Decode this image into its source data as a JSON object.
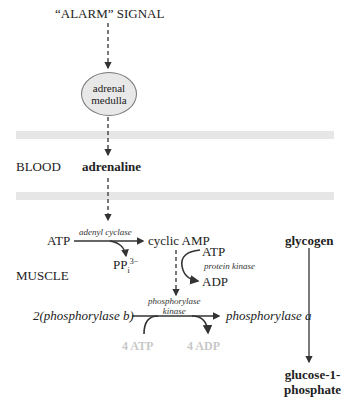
{
  "diagram": {
    "title_signal": "“ALARM” SIGNAL",
    "adrenal": {
      "line1": "adrenal",
      "line2": "medulla"
    },
    "blood_label": "BLOOD",
    "adrenaline": "adrenaline",
    "muscle_label": "MUSCLE",
    "atp_left": "ATP",
    "adenyl_cyclase": "adenyl cyclase",
    "cyclic_amp": "cyclic AMP",
    "ppi": {
      "base": "PP",
      "sub": "i",
      "sup": "3−"
    },
    "pk_atp": "ATP",
    "protein_kinase": "protein kinase",
    "pk_adp": "ADP",
    "phosphorylase_kinase": {
      "line1": "phosphorylase",
      "line2": "kinase"
    },
    "phosphorylase_b": "2(phosphorylase b)",
    "phosphorylase_a": "phosphorylase a",
    "four_atp": "4 ATP",
    "four_adp": "4 ADP",
    "glycogen": "glycogen",
    "glucose": {
      "line1": "glucose-1-",
      "line2": "phosphate"
    }
  },
  "colors": {
    "band": "#e6e6e6",
    "ellipse_fill": "#e8e8e8",
    "faded_text": "#c8c8c8",
    "line": "#333333"
  }
}
